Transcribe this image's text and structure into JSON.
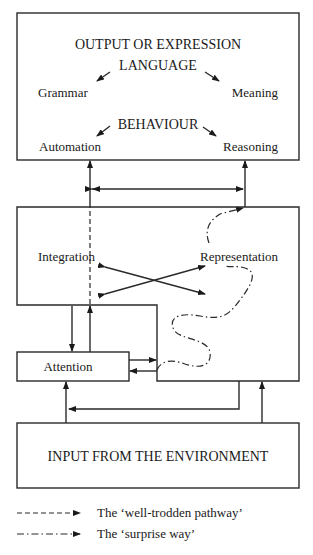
{
  "diagram": {
    "output_box": {
      "title": "OUTPUT OR EXPRESSION",
      "language": "LANGUAGE",
      "grammar": "Grammar",
      "meaning": "Meaning",
      "behaviour": "BEHAVIOUR",
      "automation": "Automation",
      "reasoning": "Reasoning"
    },
    "processing_box": {
      "integration": "Integration",
      "representation": "Representation"
    },
    "attention_box": {
      "label": "Attention"
    },
    "input_box": {
      "label": "INPUT FROM THE ENVIRONMENT"
    },
    "legend": [
      {
        "style": "dashed",
        "label": "The ‘well-trodden pathway’"
      },
      {
        "style": "dash-dot",
        "label": "The ‘surprise way’"
      }
    ]
  }
}
